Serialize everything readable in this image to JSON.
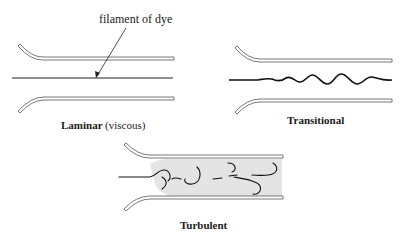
{
  "figure": {
    "annotation": "filament of dye",
    "panels": [
      {
        "id": "laminar",
        "caption_main": "Laminar",
        "caption_sub": "(viscous)"
      },
      {
        "id": "transitional",
        "caption_main": "Transitional"
      },
      {
        "id": "turbulent",
        "caption_main": "Turbulent"
      }
    ]
  },
  "colors": {
    "ink": "#1a1a1a",
    "pipe_outline": "#555555",
    "shading": "#e4e4e4",
    "background": "#ffffff"
  }
}
